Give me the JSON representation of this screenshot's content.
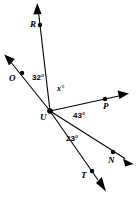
{
  "figure": {
    "type": "geometry-diagram",
    "background_color": "#ffffff",
    "stroke_color": "#000000",
    "vertex": {
      "name": "U",
      "label": "U",
      "x": 50,
      "y": 111
    },
    "rays": [
      {
        "name": "ray-UR",
        "endpoint_label": "R",
        "point": {
          "x": 40,
          "y": 25
        },
        "arrow_tip": {
          "x": 37,
          "y": 4
        },
        "label_pos": {
          "x": 30,
          "y": 21
        }
      },
      {
        "name": "ray-UO",
        "endpoint_label": "O",
        "point": {
          "x": 22,
          "y": 73
        },
        "arrow_tip": {
          "x": 5,
          "y": 56
        },
        "label_pos": {
          "x": 10,
          "y": 76
        }
      },
      {
        "name": "ray-UP",
        "endpoint_label": "P",
        "point": {
          "x": 105,
          "y": 99
        },
        "arrow_tip": {
          "x": 128,
          "y": 94
        },
        "label_pos": {
          "x": 103,
          "y": 103
        }
      },
      {
        "name": "ray-UN",
        "endpoint_label": "N",
        "point": {
          "x": 113,
          "y": 152
        },
        "arrow_tip": {
          "x": 133,
          "y": 163
        },
        "label_pos": {
          "x": 108,
          "y": 157
        }
      },
      {
        "name": "ray-UT",
        "endpoint_label": "T",
        "point": {
          "x": 92,
          "y": 171
        },
        "arrow_tip": {
          "x": 106,
          "y": 191
        },
        "label_pos": {
          "x": 82,
          "y": 172
        }
      }
    ],
    "angles": [
      {
        "name": "angle-OUR",
        "label": "32°",
        "between": "ray-UO and ray-UR",
        "label_pos": {
          "x": 32,
          "y": 75
        }
      },
      {
        "name": "angle-RUP",
        "label": "x°",
        "between": "ray-UR and ray-UP",
        "label_pos": {
          "x": 57,
          "y": 86
        }
      },
      {
        "name": "angle-PUN",
        "label": "43°",
        "between": "ray-UP and ray-UN",
        "label_pos": {
          "x": 73,
          "y": 113
        }
      },
      {
        "name": "angle-NUT",
        "label": "23°",
        "between": "ray-UN and ray-UT",
        "label_pos": {
          "x": 66,
          "y": 136
        }
      }
    ]
  }
}
